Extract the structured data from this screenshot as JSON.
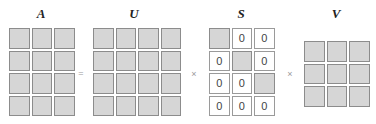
{
  "diagram": {
    "matrices": [
      {
        "name": "A",
        "rows": 4,
        "cols": 3,
        "cells": [
          [
            "",
            "",
            ""
          ],
          [
            "",
            "",
            ""
          ],
          [
            "",
            "",
            ""
          ],
          [
            "",
            "",
            ""
          ]
        ]
      },
      {
        "name": "U",
        "rows": 4,
        "cols": 4,
        "cells": [
          [
            "",
            "",
            "",
            ""
          ],
          [
            "",
            "",
            "",
            ""
          ],
          [
            "",
            "",
            "",
            ""
          ],
          [
            "",
            "",
            "",
            ""
          ]
        ]
      },
      {
        "name": "S",
        "rows": 4,
        "cols": 3,
        "cells": [
          [
            "",
            "0",
            "0"
          ],
          [
            "0",
            "",
            "0"
          ],
          [
            "0",
            "0",
            ""
          ],
          [
            "0",
            "0",
            "0"
          ]
        ]
      },
      {
        "name": "V",
        "rows": 3,
        "cols": 3,
        "cells": [
          [
            "",
            "",
            ""
          ],
          [
            "",
            "",
            ""
          ],
          [
            "",
            "",
            ""
          ]
        ]
      }
    ],
    "operators": [
      "=",
      "×",
      "×"
    ],
    "colors": {
      "filled_cell": "#d6d6d6",
      "cell_border": "#8c8c8c",
      "zero_cell": "#ffffff"
    }
  }
}
